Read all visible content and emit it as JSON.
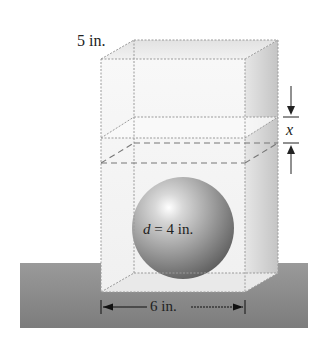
{
  "diagram": {
    "type": "geometry-figure",
    "labels": {
      "depth": "5 in.",
      "width": "6 in.",
      "sphere_var": "d",
      "sphere_eq": " = 4 in.",
      "height_gap_var": "x"
    },
    "colors": {
      "table": "#8a8a8a",
      "box_edge": "#9a9a9a",
      "side_face": "#d6d6d6",
      "sphere_highlight": "#ffffff",
      "sphere_shadow": "#6e6e6e",
      "text": "#222222"
    }
  }
}
